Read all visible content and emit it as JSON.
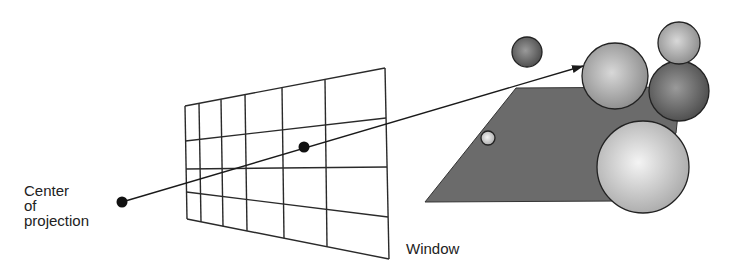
{
  "labels": {
    "center_of_projection": [
      "Center",
      "of",
      "projection"
    ],
    "window": "Window"
  },
  "colors": {
    "line": "#1a1a1a",
    "plane": "#6b6b6b",
    "sphere_light": "#f2f2f2",
    "sphere_mid": "#9a9a9a",
    "sphere_dark": "#555555"
  },
  "diagram": {
    "center_of_projection": {
      "x": 122,
      "y": 202
    },
    "window_point": {
      "x": 304,
      "y": 147
    },
    "ray_end": {
      "x": 583,
      "y": 66
    },
    "window_grid": {
      "top_left": [
        185,
        106
      ],
      "top_right": [
        385,
        68
      ],
      "bottom_left": [
        187,
        219
      ],
      "bottom_right": [
        389,
        259
      ],
      "vertical_lines_top_x": [
        185,
        199,
        221,
        245,
        282,
        325,
        385
      ],
      "vertical_lines_bottom_x": [
        187,
        201,
        223,
        247,
        284,
        327,
        389
      ],
      "horizontal_lines_left_y": [
        106,
        141,
        169,
        192,
        219
      ],
      "horizontal_lines_right_y": [
        68,
        118,
        167,
        217,
        259
      ]
    },
    "plane": [
      [
        516,
        88
      ],
      [
        681,
        87
      ],
      [
        676,
        133
      ],
      [
        620,
        201
      ],
      [
        425,
        202
      ]
    ],
    "spheres": [
      {
        "name": "small-floating",
        "cx": 527,
        "cy": 52,
        "r": 15,
        "tone": "dark"
      },
      {
        "name": "dark-back",
        "cx": 679,
        "cy": 91,
        "r": 30,
        "tone": "dark"
      },
      {
        "name": "top-right",
        "cx": 679,
        "cy": 43,
        "r": 21,
        "tone": "mid"
      },
      {
        "name": "ray-target",
        "cx": 615,
        "cy": 76,
        "r": 33,
        "tone": "mid"
      },
      {
        "name": "large-front",
        "cx": 643,
        "cy": 167,
        "r": 46,
        "tone": "light"
      },
      {
        "name": "tiny-on-plane",
        "cx": 488,
        "cy": 138,
        "r": 7,
        "tone": "light"
      }
    ]
  }
}
